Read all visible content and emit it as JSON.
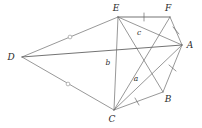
{
  "figure": {
    "type": "geometry-diagram",
    "width": 202,
    "height": 128,
    "background_color": "#ffffff",
    "line_color": "#6b6b6b",
    "label_color": "#2b2b2b"
  },
  "vertices": [
    {
      "id": "E",
      "label": "E",
      "x": 118,
      "y": 17,
      "label_x": 116,
      "label_y": 11
    },
    {
      "id": "F",
      "label": "F",
      "x": 170,
      "y": 17,
      "label_x": 168,
      "label_y": 11
    },
    {
      "id": "A",
      "label": "A",
      "x": 182,
      "y": 45,
      "label_x": 190,
      "label_y": 48
    },
    {
      "id": "D",
      "label": "D",
      "x": 22,
      "y": 57,
      "label_x": 11,
      "label_y": 60
    },
    {
      "id": "B",
      "label": "B",
      "x": 163,
      "y": 92,
      "label_x": 168,
      "label_y": 102
    },
    {
      "id": "C",
      "label": "C",
      "x": 114,
      "y": 110,
      "label_x": 112,
      "label_y": 122
    }
  ],
  "edges": [
    {
      "from": "D",
      "to": "E",
      "mark": "circle"
    },
    {
      "from": "D",
      "to": "A",
      "mark": "none"
    },
    {
      "from": "D",
      "to": "C",
      "mark": "circle"
    },
    {
      "from": "E",
      "to": "F",
      "mark": "tick"
    },
    {
      "from": "E",
      "to": "A",
      "mark": "none"
    },
    {
      "from": "E",
      "to": "C",
      "mark": "none"
    },
    {
      "from": "E",
      "to": "B",
      "mark": "none"
    },
    {
      "from": "F",
      "to": "A",
      "mark": "tick"
    },
    {
      "from": "F",
      "to": "C",
      "mark": "none"
    },
    {
      "from": "A",
      "to": "C",
      "mark": "none"
    },
    {
      "from": "A",
      "to": "B",
      "mark": "tick"
    },
    {
      "from": "B",
      "to": "C",
      "mark": "tick"
    }
  ],
  "interior_labels": [
    {
      "id": "b",
      "label": "b",
      "x": 108,
      "y": 65
    },
    {
      "id": "c",
      "label": "c",
      "x": 139,
      "y": 35
    },
    {
      "id": "a",
      "label": "a",
      "x": 136,
      "y": 81
    }
  ]
}
